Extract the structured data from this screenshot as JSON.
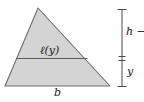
{
  "figure": {
    "type": "geometry-diagram",
    "background_color": "#ffffff",
    "shape": {
      "name": "triangle",
      "fill_color": "#d4d4d4",
      "stroke_color": "#6e6e6e",
      "apex": [
        38,
        8
      ],
      "bottom_left": [
        5,
        86
      ],
      "bottom_right": [
        110,
        86
      ]
    },
    "chord": {
      "name": "cross-section-line",
      "stroke_color": "#5a5a5a",
      "y": 58,
      "x_start": 16,
      "x_end": 88
    },
    "measure_bar": {
      "name": "height-measure-bar",
      "x": 122,
      "y_top": 9,
      "y_bottom": 87,
      "y_tick": 58,
      "stroke_color": "#4a4a4a"
    }
  },
  "labels": {
    "chord_length": "ℓ(y)",
    "base": "b",
    "upper_segment": "h − y",
    "lower_segment": "y"
  }
}
